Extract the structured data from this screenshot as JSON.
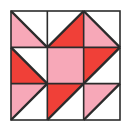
{
  "figure": {
    "name": "quilt-block",
    "grid_rows": 3,
    "grid_cols": 3
  },
  "colors": {
    "background": "#ffffff",
    "white_patch": "#ffffff",
    "light_pink": "#f7a8b8",
    "bright_red": "#f04038",
    "outline": "#2b2b2b",
    "frame": "#2b2b2b"
  },
  "geometry": {
    "frame_x": 11,
    "frame_y": 11,
    "frame_size": 109,
    "cell_size": 36.3333,
    "frame_stroke": 1.6,
    "cell_stroke": 1.6,
    "diagonal_stroke": 2.4
  },
  "chart_data": {
    "type": "diagram",
    "cells": [
      {
        "row": 0,
        "col": 0,
        "name": "cell-top-left",
        "pattern": "half-square-triangle",
        "diagonal": "tl-br",
        "upper_fill": "white_patch",
        "lower_fill": "light_pink"
      },
      {
        "row": 0,
        "col": 1,
        "name": "cell-top-center",
        "pattern": "half-square-triangle",
        "diagonal": "bl-tr",
        "upper_fill": "white_patch",
        "lower_fill": "bright_red"
      },
      {
        "row": 0,
        "col": 2,
        "name": "cell-top-right",
        "pattern": "half-square-triangle",
        "diagonal": "tl-br",
        "upper_fill": "white_patch",
        "lower_fill": "light_pink"
      },
      {
        "row": 1,
        "col": 0,
        "name": "cell-middle-left",
        "pattern": "half-square-triangle",
        "diagonal": "tl-br",
        "upper_fill": "white_patch",
        "lower_fill": "bright_red"
      },
      {
        "row": 1,
        "col": 1,
        "name": "cell-center",
        "pattern": "solid",
        "diagonal": "none",
        "upper_fill": "light_pink",
        "lower_fill": "light_pink"
      },
      {
        "row": 1,
        "col": 2,
        "name": "cell-middle-right",
        "pattern": "half-square-triangle",
        "diagonal": "bl-tr",
        "upper_fill": "bright_red",
        "lower_fill": "white_patch"
      },
      {
        "row": 2,
        "col": 0,
        "name": "cell-bottom-left",
        "pattern": "half-square-triangle",
        "diagonal": "bl-tr",
        "upper_fill": "light_pink",
        "lower_fill": "white_patch"
      },
      {
        "row": 2,
        "col": 1,
        "name": "cell-bottom-center",
        "pattern": "half-square-triangle",
        "diagonal": "bl-tr",
        "upper_fill": "bright_red",
        "lower_fill": "white_patch"
      },
      {
        "row": 2,
        "col": 2,
        "name": "cell-bottom-right",
        "pattern": "half-square-triangle",
        "diagonal": "bl-tr",
        "upper_fill": "light_pink",
        "lower_fill": "white_patch"
      }
    ],
    "legend": [],
    "xlabel": "",
    "ylabel": ""
  }
}
